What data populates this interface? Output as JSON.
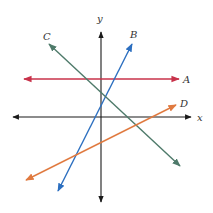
{
  "diagram": {
    "type": "coordinate-plane-lines",
    "axes": {
      "x_label": "x",
      "y_label": "y",
      "color": "#1a1a1a"
    },
    "lines": [
      {
        "id": "A",
        "label": "A",
        "color": "#c8324a",
        "description": "horizontal line above x-axis",
        "x1": 24,
        "y1": 79,
        "x2": 179,
        "y2": 79,
        "label_x": 183,
        "label_y": 83
      },
      {
        "id": "B",
        "label": "B",
        "color": "#2c6fc0",
        "description": "steep positive slope",
        "x1": 58,
        "y1": 191,
        "x2": 132,
        "y2": 44,
        "label_x": 130,
        "label_y": 38
      },
      {
        "id": "C",
        "label": "C",
        "color": "#4e7a6a",
        "description": "negative slope",
        "x1": 49,
        "y1": 44,
        "x2": 180,
        "y2": 166,
        "label_x": 43,
        "label_y": 40
      },
      {
        "id": "D",
        "label": "D",
        "color": "#e07a40",
        "description": "shallow positive slope",
        "x1": 26,
        "y1": 180,
        "x2": 176,
        "y2": 105,
        "label_x": 180,
        "label_y": 107
      }
    ]
  }
}
